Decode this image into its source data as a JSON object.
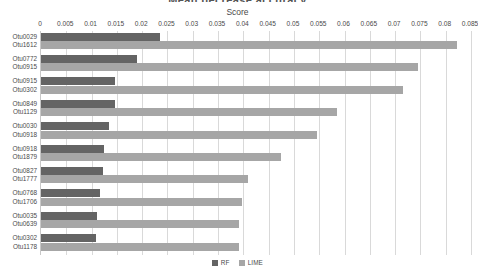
{
  "chart_title": "Mean decrease accuracy",
  "legend": {
    "position": "bottom",
    "entries": [
      {
        "label": "RF",
        "color": "#646464"
      },
      {
        "label": "LIME",
        "color": "#a6a6a6"
      }
    ]
  },
  "chart_data": {
    "type": "bar",
    "orientation": "horizontal",
    "title": "Mean decrease accuracy",
    "xlabel": "Score",
    "ylabel": "",
    "xlim": [
      0,
      0.085
    ],
    "grid": true,
    "xticks": [
      0,
      0.005,
      0.01,
      0.015,
      0.02,
      0.025,
      0.03,
      0.035,
      0.04,
      0.045,
      0.05,
      0.055,
      0.06,
      0.065,
      0.07,
      0.075,
      0.08,
      0.085
    ],
    "xticklabels": [
      "0",
      "0.005",
      "0.01",
      "0.015",
      "0.02",
      "0.025",
      "0.03",
      "0.035",
      "0.04",
      "0.045",
      "0.05",
      "0.055",
      "0.06",
      "0.065",
      "0.07",
      "0.075",
      "0.08",
      "0.085"
    ],
    "groups": [
      {
        "rf_label": "Otu0029",
        "lime_label": "Otu1612",
        "rf": 0.0235,
        "lime": 0.0822
      },
      {
        "rf_label": "Otu0772",
        "lime_label": "Otu0915",
        "rf": 0.0189,
        "lime": 0.0745
      },
      {
        "rf_label": "Otu0915",
        "lime_label": "Otu0302",
        "rf": 0.0147,
        "lime": 0.0715
      },
      {
        "rf_label": "Otu0849",
        "lime_label": "Otu1129",
        "rf": 0.0146,
        "lime": 0.0585
      },
      {
        "rf_label": "Otu0030",
        "lime_label": "Otu0918",
        "rf": 0.0134,
        "lime": 0.0545
      },
      {
        "rf_label": "Otu0918",
        "lime_label": "Otu1879",
        "rf": 0.0125,
        "lime": 0.0475
      },
      {
        "rf_label": "Otu0827",
        "lime_label": "Otu1777",
        "rf": 0.0122,
        "lime": 0.041
      },
      {
        "rf_label": "Otu0768",
        "lime_label": "Otu1706",
        "rf": 0.0117,
        "lime": 0.0397
      },
      {
        "rf_label": "Otu0035",
        "lime_label": "Otu0639",
        "rf": 0.011,
        "lime": 0.0392
      },
      {
        "rf_label": "Otu0302",
        "lime_label": "Otu1178",
        "rf": 0.0108,
        "lime": 0.0391
      }
    ],
    "series": [
      {
        "name": "RF",
        "color": "#646464",
        "values": [
          0.0235,
          0.0189,
          0.0147,
          0.0146,
          0.0134,
          0.0125,
          0.0122,
          0.0117,
          0.011,
          0.0108
        ]
      },
      {
        "name": "LIME",
        "color": "#a6a6a6",
        "values": [
          0.0822,
          0.0745,
          0.0715,
          0.0585,
          0.0545,
          0.0475,
          0.041,
          0.0397,
          0.0392,
          0.0391
        ]
      }
    ]
  }
}
